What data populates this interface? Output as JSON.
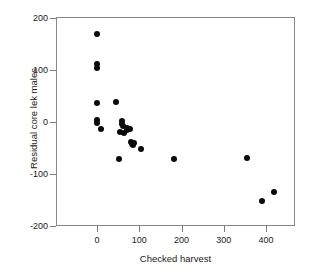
{
  "chart_data": {
    "type": "scatter",
    "title": "",
    "xlabel": "Checked harvest",
    "ylabel": "Residual core lek males",
    "xlim": [
      -40,
      525
    ],
    "ylim": [
      -200,
      200
    ],
    "xticks": [
      0,
      100,
      200,
      300,
      400
    ],
    "yticks": [
      200,
      100,
      0,
      -100,
      -200
    ],
    "xtick_labels": [
      "0",
      "100",
      "200",
      "300",
      "400"
    ],
    "ytick_labels": [
      "200",
      "100",
      "0",
      "-100",
      "-200"
    ],
    "grid": false,
    "legend": null,
    "marker": {
      "shape": "circle",
      "color": "#0b0b0b",
      "size_px": 6
    },
    "series": [
      {
        "name": "Residual core lek males vs checked harvest",
        "points": [
          [
            0,
            170
          ],
          [
            0,
            112
          ],
          [
            0,
            104
          ],
          [
            0,
            36
          ],
          [
            0,
            4
          ],
          [
            0,
            -2
          ],
          [
            10,
            -14
          ],
          [
            46,
            39
          ],
          [
            52,
            -72
          ],
          [
            55,
            -19
          ],
          [
            58,
            2
          ],
          [
            60,
            -4
          ],
          [
            62,
            -8
          ],
          [
            63,
            -21
          ],
          [
            70,
            -12
          ],
          [
            72,
            -16
          ],
          [
            78,
            -14
          ],
          [
            80,
            -38
          ],
          [
            83,
            -43
          ],
          [
            86,
            -45
          ],
          [
            88,
            -41
          ],
          [
            104,
            -52
          ],
          [
            183,
            -71
          ],
          [
            355,
            -69
          ],
          [
            390,
            -152
          ],
          [
            420,
            -134
          ]
        ]
      }
    ]
  },
  "axes": {
    "frame_color": "#8a8a8a",
    "tick_color": "#7d7d7d",
    "background": "#ffffff"
  }
}
